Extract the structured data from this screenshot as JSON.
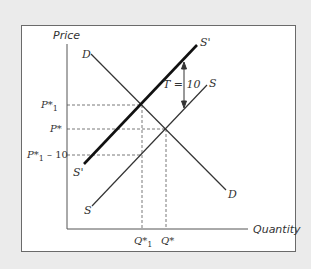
{
  "diagram": {
    "type": "supply-demand-tax",
    "axes": {
      "y_label": "Price",
      "x_label": "Quantity"
    },
    "curves": [
      {
        "name": "D",
        "start_label": "D",
        "end_label": "D",
        "style": "thin"
      },
      {
        "name": "S",
        "start_label": "S",
        "end_label": "S",
        "style": "thin"
      },
      {
        "name": "S'",
        "start_label": "S'",
        "end_label": "S'",
        "style": "thick"
      }
    ],
    "price_labels": {
      "p1_star": "P*",
      "p1_star_sub": "1",
      "p_star": "P*",
      "p1_minus": "P*",
      "p1_minus_sub": "1",
      "p1_minus_suffix": " – 10"
    },
    "quantity_labels": {
      "q1_star": "Q*",
      "q1_star_sub": "1",
      "q_star": "Q*"
    },
    "annotation": {
      "tax_label": "T = 10"
    },
    "colors": {
      "background": "#ebebeb",
      "panel": "#ffffff",
      "line": "#333333",
      "dashed": "#555555"
    }
  }
}
